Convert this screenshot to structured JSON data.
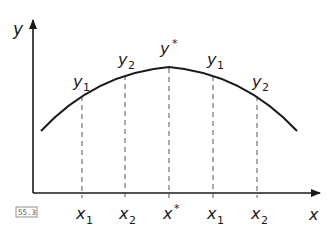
{
  "figure": {
    "tag": "55.3",
    "axes": {
      "y_label": "y",
      "x_label": "x"
    },
    "curve": {
      "type": "concave-down parabola",
      "color": "#1a1a1a"
    },
    "top_labels": [
      {
        "base": "y",
        "sub": "1"
      },
      {
        "base": "y",
        "sub": "2"
      },
      {
        "base": "y",
        "sup": "*"
      },
      {
        "base": "y",
        "sub": "1"
      },
      {
        "base": "y",
        "sub": "2"
      }
    ],
    "bottom_labels": [
      {
        "base": "x",
        "sub": "1"
      },
      {
        "base": "x",
        "sub": "2"
      },
      {
        "base": "x",
        "sup": "*"
      },
      {
        "base": "x",
        "sub": "1"
      },
      {
        "base": "x",
        "sub": "2"
      }
    ]
  }
}
